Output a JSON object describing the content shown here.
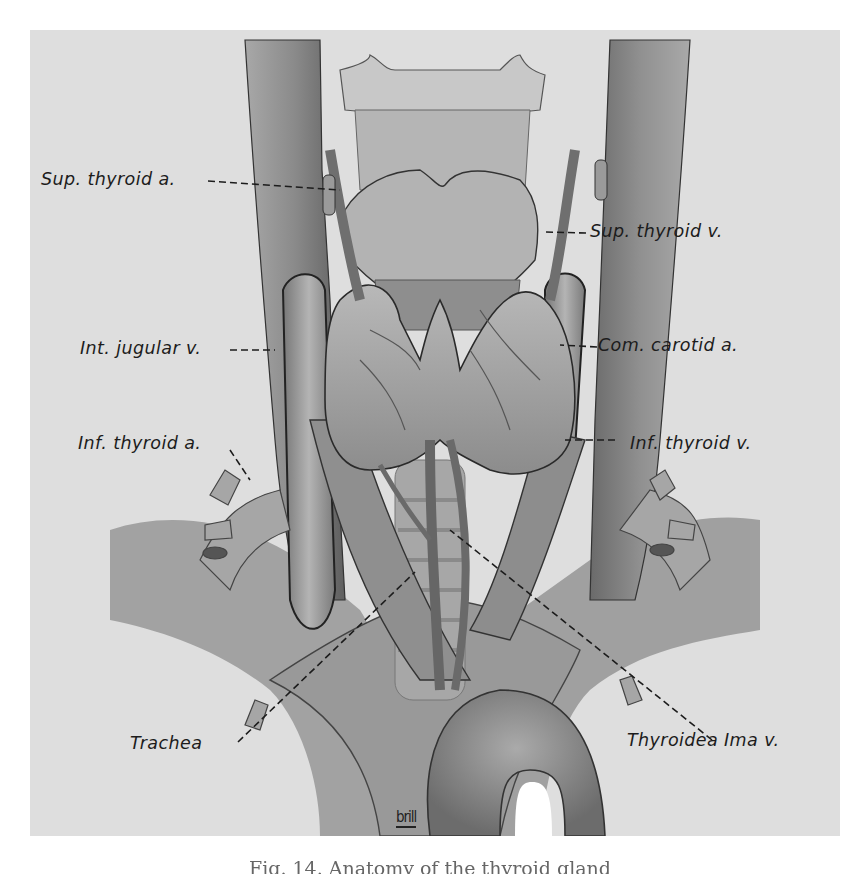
{
  "figure": {
    "background_color": "#dedede",
    "ink_color": "#1c1c1c",
    "vessel_color": "#8e8e8e",
    "signature": "brill",
    "caption_partial": "Fig. 14. Anatomy of the thyroid gland"
  },
  "labels": [
    {
      "id": "sup-thyroid-artery",
      "text": "Sup. thyroid a.",
      "side": "left"
    },
    {
      "id": "sup-thyroid-vein",
      "text": "Sup. thyroid v.",
      "side": "right"
    },
    {
      "id": "int-jugular-vein",
      "text": "Int. jugular v.",
      "side": "left"
    },
    {
      "id": "com-carotid-artery",
      "text": "Com. carotid a.",
      "side": "right"
    },
    {
      "id": "inf-thyroid-artery",
      "text": "Inf. thyroid a.",
      "side": "left"
    },
    {
      "id": "inf-thyroid-vein",
      "text": "Inf. thyroid v.",
      "side": "right"
    },
    {
      "id": "trachea",
      "text": "Trachea",
      "side": "left"
    },
    {
      "id": "thyroidea-ima-vein",
      "text": "Thyroidea Ima v.",
      "side": "right"
    }
  ]
}
